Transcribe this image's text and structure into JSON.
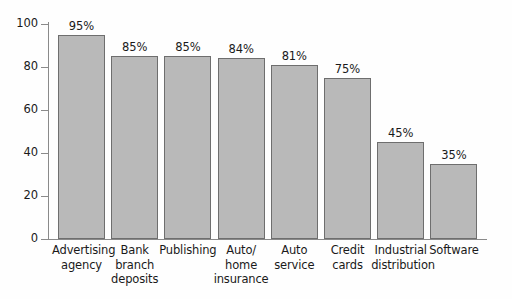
{
  "chart_data": {
    "type": "bar",
    "title": "",
    "subtitle": "",
    "xlabel": "",
    "ylabel": "",
    "ylim": [
      0,
      100
    ],
    "yticks": [
      0,
      20,
      40,
      60,
      80,
      100
    ],
    "ytick_labels": [
      "0",
      "20",
      "40",
      "60",
      "80",
      "100"
    ],
    "grid": false,
    "legend": false,
    "legend_position": "none",
    "categories": [
      "Advertising agency",
      "Bank branch deposits",
      "Publishing",
      "Auto/ home insurance",
      "Auto service",
      "Credit cards",
      "Industrial distribution",
      "Software"
    ],
    "category_lines": [
      [
        "Advertising",
        "agency"
      ],
      [
        "Bank",
        "branch",
        "deposits"
      ],
      [
        "Publishing"
      ],
      [
        "Auto/",
        "home",
        "insurance"
      ],
      [
        "Auto",
        "service"
      ],
      [
        "Credit",
        "cards"
      ],
      [
        "Industrial",
        "distribution"
      ],
      [
        "Software"
      ]
    ],
    "values": [
      95,
      85,
      85,
      84,
      81,
      75,
      45,
      35
    ],
    "data_labels": [
      "95%",
      "85%",
      "85%",
      "84%",
      "81%",
      "75%",
      "45%",
      "35%"
    ],
    "bar_fill_color": "#b9b9b9",
    "bar_border_color": "#6e6e6e",
    "axis_color": "#8a8a8a",
    "text_color": "#1a1a1a",
    "background_color": "#fefefe"
  }
}
